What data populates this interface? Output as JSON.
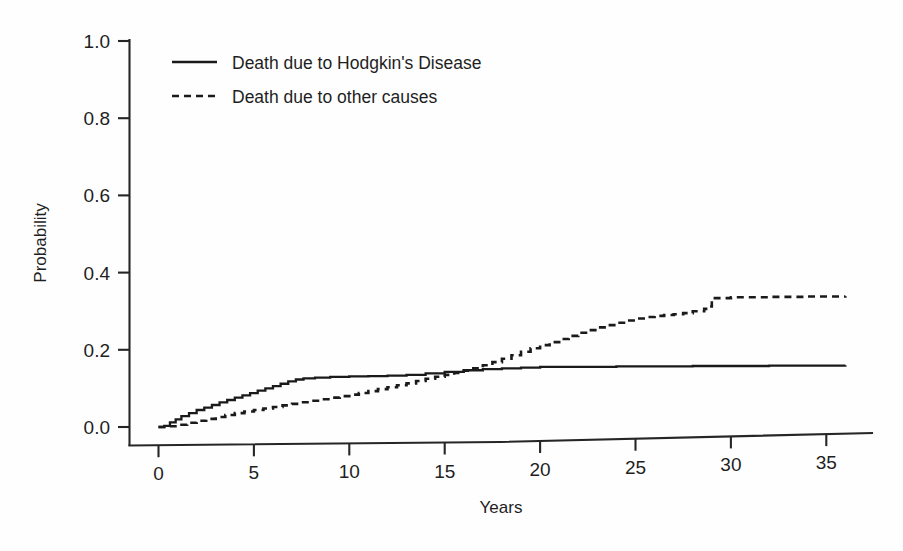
{
  "chart_data": {
    "type": "line",
    "title": "",
    "subtitle": "",
    "xlabel": "Years",
    "ylabel": "Probability",
    "xlim": [
      0,
      37.3
    ],
    "ylim": [
      0.0,
      1.0
    ],
    "grid": false,
    "legend_position": "top-left-inside",
    "x_ticks": [
      0,
      5,
      10,
      15,
      20,
      25,
      30,
      35
    ],
    "x_tick_labels": [
      "0",
      "5",
      "10",
      "15",
      "20",
      "25",
      "30",
      "35"
    ],
    "y_ticks": [
      0.0,
      0.2,
      0.4,
      0.6,
      0.8,
      1.0
    ],
    "y_tick_labels": [
      "0.0",
      "0.2",
      "0.4",
      "0.6",
      "0.8",
      "1.0"
    ],
    "series": [
      {
        "name": "Death due to Hodgkin's Disease",
        "style": "solid",
        "color": "#1a1a1a",
        "points": [
          [
            0.0,
            0.0
          ],
          [
            0.3,
            0.003
          ],
          [
            0.6,
            0.012
          ],
          [
            0.9,
            0.02
          ],
          [
            1.2,
            0.028
          ],
          [
            1.6,
            0.036
          ],
          [
            2.0,
            0.044
          ],
          [
            2.4,
            0.05
          ],
          [
            2.8,
            0.057
          ],
          [
            3.2,
            0.064
          ],
          [
            3.6,
            0.07
          ],
          [
            4.0,
            0.076
          ],
          [
            4.4,
            0.082
          ],
          [
            4.8,
            0.088
          ],
          [
            5.2,
            0.094
          ],
          [
            5.6,
            0.1
          ],
          [
            6.0,
            0.106
          ],
          [
            6.4,
            0.112
          ],
          [
            6.8,
            0.118
          ],
          [
            7.2,
            0.123
          ],
          [
            7.6,
            0.126
          ],
          [
            8.2,
            0.128
          ],
          [
            9.0,
            0.13
          ],
          [
            10.0,
            0.131
          ],
          [
            11.0,
            0.132
          ],
          [
            12.0,
            0.133
          ],
          [
            13.0,
            0.135
          ],
          [
            14.0,
            0.139
          ],
          [
            15.0,
            0.143
          ],
          [
            16.0,
            0.147
          ],
          [
            17.0,
            0.15
          ],
          [
            18.0,
            0.152
          ],
          [
            19.0,
            0.154
          ],
          [
            20.0,
            0.156
          ],
          [
            24.0,
            0.157
          ],
          [
            28.0,
            0.158
          ],
          [
            32.0,
            0.159
          ],
          [
            36.0,
            0.16
          ]
        ]
      },
      {
        "name": "Death due to other causes",
        "style": "dashed",
        "color": "#1a1a1a",
        "points": [
          [
            0.0,
            0.0
          ],
          [
            0.5,
            0.002
          ],
          [
            1.0,
            0.006
          ],
          [
            1.5,
            0.011
          ],
          [
            2.0,
            0.016
          ],
          [
            2.5,
            0.021
          ],
          [
            3.0,
            0.026
          ],
          [
            3.5,
            0.031
          ],
          [
            4.0,
            0.036
          ],
          [
            4.5,
            0.04
          ],
          [
            5.0,
            0.044
          ],
          [
            5.5,
            0.048
          ],
          [
            6.0,
            0.052
          ],
          [
            6.5,
            0.056
          ],
          [
            7.0,
            0.06
          ],
          [
            7.5,
            0.064
          ],
          [
            8.0,
            0.068
          ],
          [
            8.5,
            0.072
          ],
          [
            9.0,
            0.076
          ],
          [
            9.5,
            0.08
          ],
          [
            10.0,
            0.084
          ],
          [
            10.5,
            0.088
          ],
          [
            11.0,
            0.093
          ],
          [
            11.5,
            0.098
          ],
          [
            12.0,
            0.103
          ],
          [
            12.5,
            0.108
          ],
          [
            13.0,
            0.113
          ],
          [
            13.5,
            0.119
          ],
          [
            14.0,
            0.125
          ],
          [
            14.5,
            0.13
          ],
          [
            15.0,
            0.135
          ],
          [
            15.5,
            0.14
          ],
          [
            16.0,
            0.146
          ],
          [
            16.5,
            0.152
          ],
          [
            17.0,
            0.16
          ],
          [
            17.5,
            0.168
          ],
          [
            18.0,
            0.177
          ],
          [
            18.5,
            0.186
          ],
          [
            19.0,
            0.195
          ],
          [
            19.5,
            0.204
          ],
          [
            20.0,
            0.212
          ],
          [
            20.5,
            0.22
          ],
          [
            21.0,
            0.228
          ],
          [
            21.5,
            0.236
          ],
          [
            22.0,
            0.244
          ],
          [
            22.5,
            0.251
          ],
          [
            23.0,
            0.258
          ],
          [
            23.5,
            0.264
          ],
          [
            24.0,
            0.27
          ],
          [
            24.5,
            0.276
          ],
          [
            25.0,
            0.281
          ],
          [
            25.5,
            0.285
          ],
          [
            26.0,
            0.288
          ],
          [
            26.5,
            0.29
          ],
          [
            27.0,
            0.292
          ],
          [
            27.5,
            0.295
          ],
          [
            28.0,
            0.3
          ],
          [
            28.6,
            0.306
          ],
          [
            28.9,
            0.312
          ],
          [
            29.0,
            0.334
          ],
          [
            30.0,
            0.336
          ],
          [
            32.0,
            0.337
          ],
          [
            34.0,
            0.338
          ],
          [
            36.0,
            0.339
          ]
        ]
      }
    ],
    "annotations": []
  },
  "legend": {
    "entries": [
      {
        "label": "Death due to Hodgkin's Disease",
        "style": "solid"
      },
      {
        "label": "Death due to other causes",
        "style": "dashed"
      }
    ]
  },
  "axes": {
    "x_title": "Years",
    "y_title": "Probability"
  },
  "colors": {
    "ink": "#1a1a1a",
    "axis": "#262626",
    "background": "#fefefe"
  }
}
